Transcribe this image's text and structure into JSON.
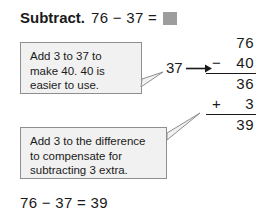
{
  "heading": {
    "label": "Subtract.",
    "expression": "76 − 37 =",
    "answer_placeholder_icon": "gray-answer-box"
  },
  "callouts": [
    {
      "id": "callout-1",
      "lines": [
        "Add 3 to 37 to",
        "make 40. 40 is",
        "easier to use."
      ],
      "points_to": "37"
    },
    {
      "id": "callout-2",
      "lines": [
        "Add 3 to the difference",
        "to compensate for",
        "subtracting 3 extra."
      ],
      "points_to": "+ 3"
    }
  ],
  "middle": {
    "term": "37",
    "arrow_icon": "right-arrow-icon"
  },
  "calculation": {
    "rows": [
      {
        "operator": "",
        "number": "76",
        "ruled": false
      },
      {
        "operator": "−",
        "number": "40",
        "ruled": true
      },
      {
        "operator": "",
        "number": "36",
        "ruled": false
      },
      {
        "operator": "+",
        "number": "3",
        "ruled": true
      },
      {
        "operator": "",
        "number": "39",
        "ruled": false
      }
    ]
  },
  "result": {
    "equation": "76 − 37 = 39"
  },
  "colors": {
    "text": "#1a1a1a",
    "callout_fill": "#f1f1f1",
    "callout_border": "#8e8e8e",
    "answer_box": "#9d9d9d"
  }
}
